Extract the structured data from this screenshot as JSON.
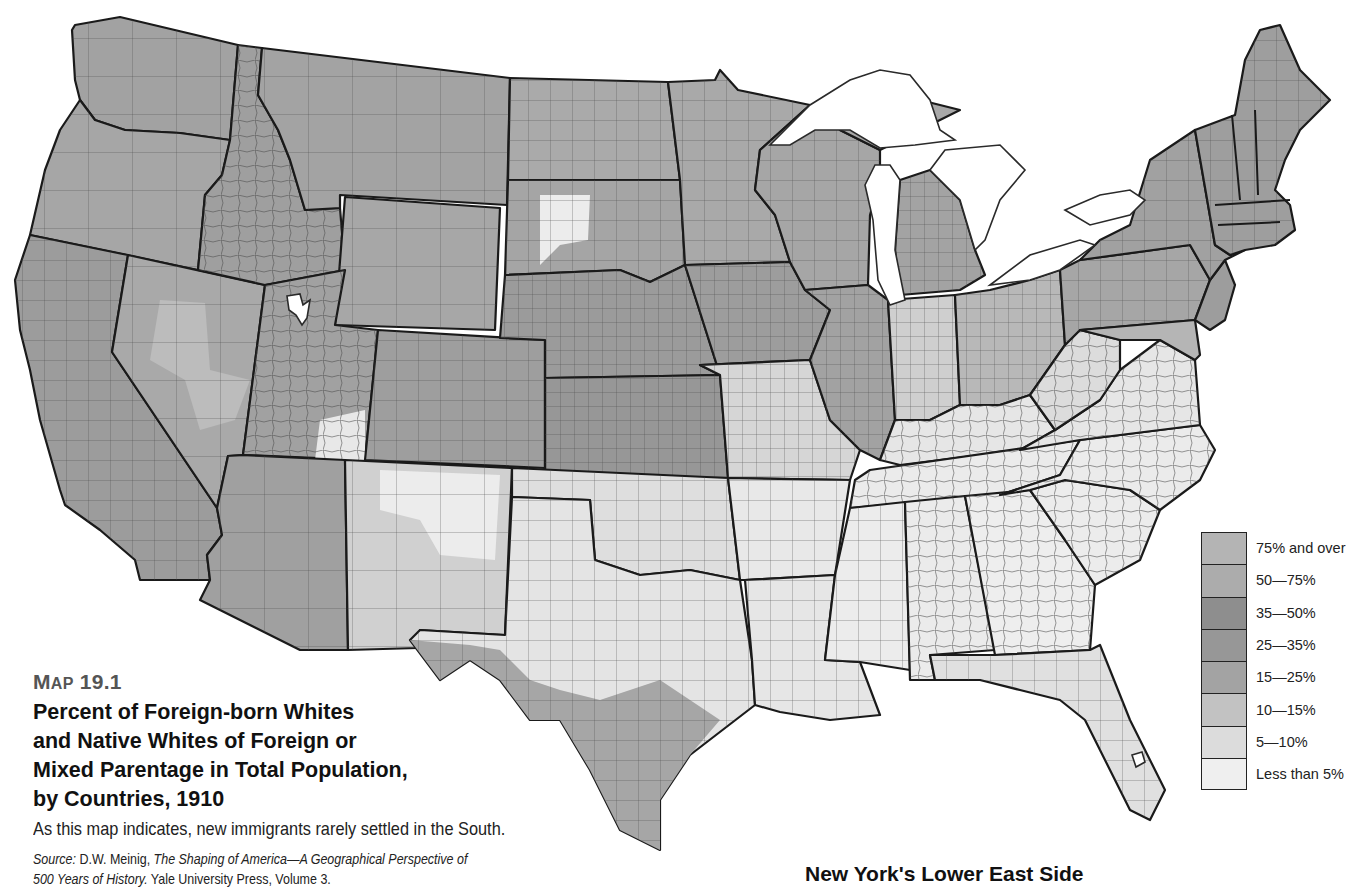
{
  "map": {
    "number_prefix": "M",
    "number_prefix_small": "AP",
    "number": "19.1",
    "title_lines": [
      "Percent of Foreign-born Whites",
      "and Native Whites of Foreign or",
      "Mixed Parentage in Total Population,",
      "by Countries, 1910"
    ],
    "description": "As this map indicates, new immigrants rarely settled in the South.",
    "source": {
      "label": "Source:",
      "author": " D.W. Meinig, ",
      "book_title_1": "The Shaping of America—A Geographical Perspective of",
      "book_title_2": "500 Years of History.",
      "publisher": " Yale University Press, Volume 3."
    }
  },
  "legend": {
    "items": [
      {
        "label": "75% and over",
        "color": "#b4b4b4"
      },
      {
        "label": "50—75%",
        "color": "#acacac"
      },
      {
        "label": "35—50%",
        "color": "#8e8e8e"
      },
      {
        "label": "25—35%",
        "color": "#979797"
      },
      {
        "label": "15—25%",
        "color": "#a3a3a3"
      },
      {
        "label": "10—15%",
        "color": "#c2c2c2"
      },
      {
        "label": "5—10%",
        "color": "#dcdcdc"
      },
      {
        "label": "Less than 5%",
        "color": "#efefef"
      }
    ]
  },
  "regions": {
    "pacific_northwest": "#a2a2a2",
    "mountain_north": "#a5a5a5",
    "great_basin": "#b0b0b0",
    "california": "#9c9c9c",
    "southwest": "#a4a4a4",
    "plains_north": "#aaaaaa",
    "plains_central": "#9a9a9a",
    "midwest": "#a0a0a0",
    "northeast": "#9d9d9d",
    "border_south": "#d8d8d8",
    "deep_south": "#ececec",
    "texas_west": "#e6e6e6",
    "texas_south": "#a8a8a8",
    "florida": "#e2e2e2"
  },
  "bottom_heading": "New York's Lower East Side"
}
